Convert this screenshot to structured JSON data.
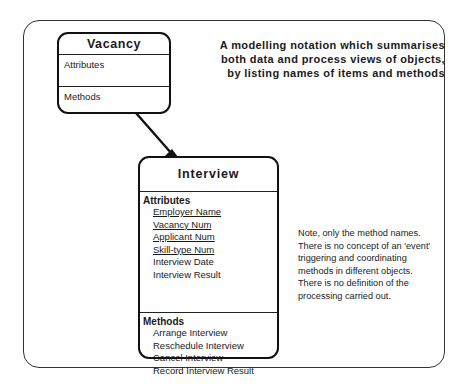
{
  "heading": {
    "lines": [
      "A modelling notation which summarises",
      "both data and process views of objects,",
      "by listing names of items and methods"
    ]
  },
  "vacancy": {
    "title": "Vacancy",
    "attributes_label": "Attributes",
    "methods_label": "Methods"
  },
  "interview": {
    "title": "Interview",
    "attributes_label": "Attributes",
    "attributes": [
      {
        "name": "Employer Name",
        "key": true
      },
      {
        "name": "Vacancy Num",
        "key": true
      },
      {
        "name": "Applicant Num",
        "key": true
      },
      {
        "name": "Skill-type Num",
        "key": true
      },
      {
        "name": "Interview Date",
        "key": false
      },
      {
        "name": "Interview Result",
        "key": false
      }
    ],
    "methods_label": "Methods",
    "methods": [
      "Arrange Interview",
      "Reschedule Interview",
      "Cancel Interview",
      "Record Interview Result"
    ]
  },
  "note": {
    "lines": [
      "Note, only the method names.",
      "There is no concept of an 'event'",
      "triggering and coordinating",
      "methods in different objects.",
      "There is no definition of the",
      "processing carried out."
    ]
  },
  "connector": {
    "from": "Vacancy",
    "to": "Interview",
    "style": "crow-foot at Interview end"
  }
}
